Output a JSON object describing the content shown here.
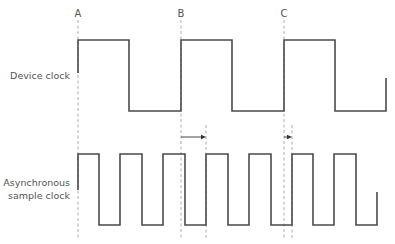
{
  "diagram": {
    "type": "timing-diagram",
    "markers": [
      {
        "label": "A",
        "x": 78
      },
      {
        "label": "B",
        "x": 181
      },
      {
        "label": "C",
        "x": 284
      }
    ],
    "extra_guides": [
      {
        "x": 206,
        "y1": 125,
        "y2": 240
      },
      {
        "x": 292,
        "y1": 125,
        "y2": 240
      }
    ],
    "signals": [
      {
        "name": "device-clock",
        "label_lines": [
          "Device clock"
        ],
        "high_y": 40,
        "low_y": 111,
        "edges_x": [
          129,
          181,
          232,
          284,
          335
        ],
        "start": {
          "x": 78,
          "y": 73
        },
        "end": {
          "x": 386,
          "y": 78
        }
      },
      {
        "name": "sample-clock",
        "label_lines": [
          "Asynchronous",
          "sample clock"
        ],
        "high_y": 154,
        "low_y": 225,
        "edges_x": [
          99,
          120,
          142,
          163,
          185,
          206,
          228,
          249,
          271,
          292,
          313,
          334,
          356
        ],
        "start": {
          "x": 78,
          "y": 190
        },
        "end": {
          "x": 377,
          "y": 192
        }
      }
    ],
    "delay_arrows": [
      {
        "from_x": 181,
        "to_x": 206,
        "y": 137
      },
      {
        "from_x": 284,
        "to_x": 292,
        "y": 137
      }
    ],
    "colors": {
      "waveform": "#4a4a4a",
      "guide": "#9a9a9a",
      "text": "#555555"
    }
  }
}
